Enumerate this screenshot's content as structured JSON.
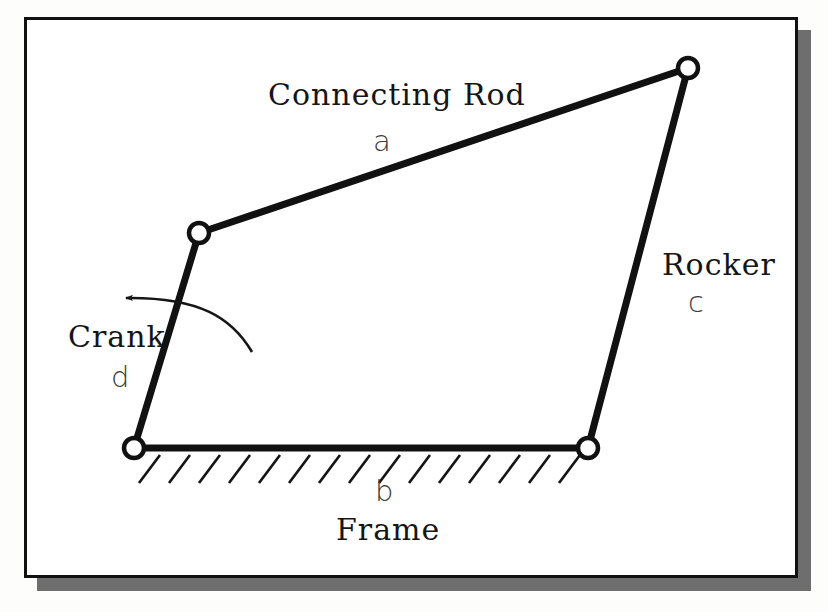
{
  "figure": {
    "type": "four-bar-linkage-diagram",
    "background_color": "#ffffff",
    "border_color": "#111111",
    "shadow_color": "#6e6e6e",
    "link_color": "#111111"
  },
  "labels": {
    "connecting_rod": "Connecting Rod",
    "connecting_rod_letter": "a",
    "rocker": "Rocker",
    "rocker_letter": "c",
    "crank": "Crank",
    "crank_letter": "d",
    "frame": "Frame",
    "frame_letter": "b"
  },
  "geometry": {
    "joints": [
      {
        "name": "crank-ground-pivot",
        "x": 134,
        "y": 448
      },
      {
        "name": "crank-coupler-joint",
        "x": 199,
        "y": 233
      },
      {
        "name": "coupler-rocker-joint",
        "x": 688,
        "y": 68
      },
      {
        "name": "rocker-ground-pivot",
        "x": 588,
        "y": 448
      }
    ],
    "links": [
      {
        "name": "crank",
        "letter": "d",
        "from": "crank-ground-pivot",
        "to": "crank-coupler-joint"
      },
      {
        "name": "connecting-rod",
        "letter": "a",
        "from": "crank-coupler-joint",
        "to": "coupler-rocker-joint"
      },
      {
        "name": "rocker",
        "letter": "c",
        "from": "coupler-rocker-joint",
        "to": "rocker-ground-pivot"
      },
      {
        "name": "frame",
        "letter": "b",
        "from": "crank-ground-pivot",
        "to": "rocker-ground-pivot"
      }
    ],
    "ground_hatching": {
      "from_x": 145,
      "to_x": 582,
      "y": 452,
      "marks": 15
    },
    "rotation_arrow": {
      "direction": "counterclockwise",
      "points_toward": "left"
    }
  }
}
